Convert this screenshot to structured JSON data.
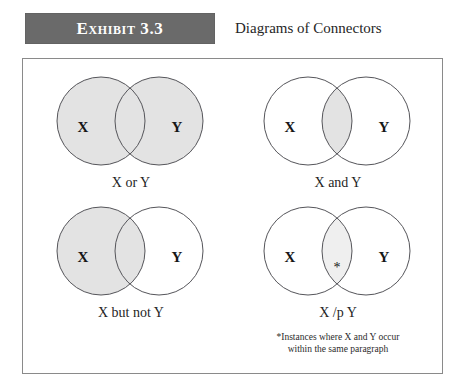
{
  "header": {
    "badge_label": "Exhibit 3.3",
    "title": "Diagrams of Connectors",
    "badge_color": "#6a6a6a",
    "badge_text_color": "#ffffff"
  },
  "frame": {
    "border_color": "#8a8a8a",
    "background": "#ffffff"
  },
  "style": {
    "shade_color": "#e3e3e3",
    "faint_shade_color": "#efefef",
    "circle_stroke": "#55555a"
  },
  "diagrams": [
    {
      "id": "x-or-y",
      "position": "tl",
      "left_label": "X",
      "right_label": "Y",
      "caption": "X or Y",
      "shading": "union",
      "marker": "",
      "footnote": []
    },
    {
      "id": "x-and-y",
      "position": "tr",
      "left_label": "X",
      "right_label": "Y",
      "caption": "X and Y",
      "shading": "intersection",
      "marker": "",
      "footnote": []
    },
    {
      "id": "x-but-not-y",
      "position": "bl",
      "left_label": "X",
      "right_label": "Y",
      "caption": "X but not Y",
      "shading": "left-difference",
      "marker": "",
      "footnote": []
    },
    {
      "id": "x-slash-p-y",
      "position": "br",
      "left_label": "X",
      "right_label": "Y",
      "caption": "X /p Y",
      "shading": "faint-intersection",
      "marker": "*",
      "footnote": [
        "*Instances where X and Y occur",
        "within the same paragraph"
      ]
    }
  ]
}
